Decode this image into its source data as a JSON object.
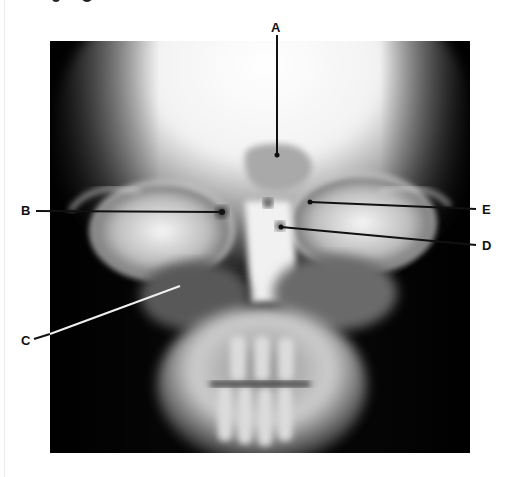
{
  "figure": {
    "type": "radiograph",
    "view": "frontal skull x-ray (facial bones)",
    "colors": {
      "background": "#ffffff",
      "film_dark": "#050505",
      "bone_bright": "#f4f4f4",
      "label_color": "#111111",
      "leader_dark": "#111111",
      "leader_light": "#f0f0f0"
    },
    "labels": [
      {
        "id": "A",
        "text": "A"
      },
      {
        "id": "B",
        "text": "B"
      },
      {
        "id": "C",
        "text": "C"
      },
      {
        "id": "D",
        "text": "D"
      },
      {
        "id": "E",
        "text": "E"
      }
    ]
  }
}
